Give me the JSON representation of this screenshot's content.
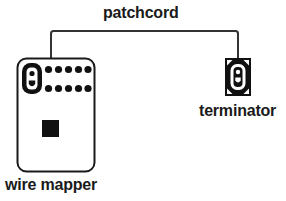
{
  "diagram": {
    "background_color": "#ffffff",
    "stroke_color": "#1a1a1a",
    "fill_black": "#111111",
    "fill_white": "#ffffff",
    "labels": {
      "patchcord": "patchcord",
      "wire_mapper": "wire mapper",
      "terminator": "terminator"
    },
    "devices": [
      {
        "id": "wire-mapper",
        "label": "wire mapper",
        "shape": "rounded-rectangle",
        "fill": "#ffffff",
        "outline": "#1a1a1a",
        "x": 17,
        "y": 58,
        "width": 78,
        "height": 114,
        "parts": {
          "port_label": "rj45-port",
          "led_rows": 2,
          "leds_per_row": 5,
          "led_total": 10,
          "button_label": "test-button",
          "button_fill": "#111111"
        }
      },
      {
        "id": "terminator",
        "label": "terminator",
        "shape": "rectangle",
        "fill": "#111111",
        "outline": "#111111",
        "x": 225,
        "y": 58,
        "width": 26,
        "height": 38,
        "parts": {
          "port_label": "rj45-port",
          "corner_notches": 4
        }
      }
    ],
    "connector": {
      "id": "patchcord",
      "label": "patchcord",
      "stroke": "#333333",
      "stroke_width": 2,
      "from": "wire-mapper",
      "to": "terminator",
      "path": "M 51 58 L 51 33 Q 51 31 53 31 L 236 31 Q 238 31 238 33 L 238 58"
    }
  }
}
